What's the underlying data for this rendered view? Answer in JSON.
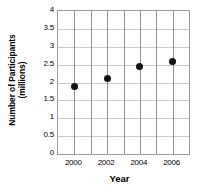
{
  "chart_data": {
    "type": "scatter",
    "title": "",
    "xlabel": "Year",
    "ylabel_line1": "Number of Participants",
    "ylabel_line2": "(millions)",
    "ylabel": "Number of Participants (millions)",
    "x": [
      2000,
      2002,
      2004,
      2006
    ],
    "values": [
      1.9,
      2.1,
      2.45,
      2.6
    ],
    "points": [
      {
        "x": 2000,
        "y": 1.9
      },
      {
        "x": 2002,
        "y": 2.1
      },
      {
        "x": 2004,
        "y": 2.45
      },
      {
        "x": 2006,
        "y": 2.6
      }
    ],
    "xlim": [
      1999,
      2007
    ],
    "ylim": [
      0,
      4
    ],
    "ytick_labels": [
      "0",
      "0.5",
      "1",
      "1.5",
      "2",
      "2.5",
      "3",
      "3.5",
      "4"
    ],
    "ytick_values": [
      0,
      0.5,
      1,
      1.5,
      2,
      2.5,
      3,
      3.5,
      4
    ],
    "xtick_labels": [
      "2000",
      "2002",
      "2004",
      "2006"
    ],
    "xtick_values": [
      2000,
      2002,
      2004,
      2006
    ],
    "x_gridline_values": [
      2000,
      2001,
      2002,
      2003,
      2004,
      2005,
      2006
    ],
    "grid": true,
    "legend": null,
    "marker_color": "#111111",
    "grid_color": "#c8c8c8",
    "axis_color": "#9a9a9a"
  }
}
